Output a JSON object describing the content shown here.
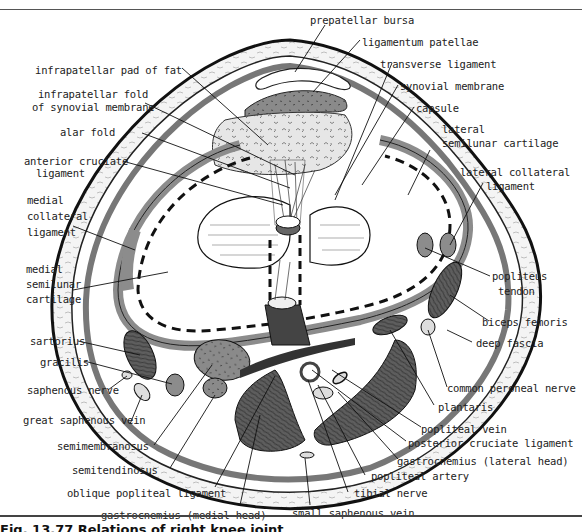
{
  "figure": {
    "caption": "Fig. 13.77 Relations of right knee joint",
    "colors": {
      "ink": "#1a1a1a",
      "tissue_gray": "#8c8c8c",
      "muscle_dark": "#555555",
      "fat_light": "#dcdcdc",
      "background": "#ffffff"
    }
  },
  "labels": {
    "prepatellar_bursa": "prepatellar bursa",
    "ligamentum_patellae": "ligamentum patellae",
    "infrapatellar_pad_of_fat": "infrapatellar pad of fat",
    "transverse_ligament": "transverse ligament",
    "infrapatellar_fold_1": "infrapatellar fold",
    "infrapatellar_fold_2": "of synovial membrane",
    "synovial_membrane": "synovial membrane",
    "capsule": "capsule",
    "alar_fold": "alar fold",
    "lateral_semilunar_cartilage_1": "lateral",
    "lateral_semilunar_cartilage_2": "semilunar cartilage",
    "anterior_cruciate_ligament_1": "anterior cruciate",
    "anterior_cruciate_ligament_2": "ligament",
    "lateral_collateral_ligament_1": "lateral collateral",
    "lateral_collateral_ligament_2": "ligament",
    "medial_collateral_ligament_1": "medial",
    "medial_collateral_ligament_2": "collateral",
    "medial_collateral_ligament_3": "ligament",
    "medial_semilunar_cartilage_1": "medial",
    "medial_semilunar_cartilage_2": "semilunar",
    "medial_semilunar_cartilage_3": "cartilage",
    "popliteus_tendon_1": "popliteus",
    "popliteus_tendon_2": "tendon",
    "biceps_femoris": "biceps femoris",
    "sartorius": "sartorius",
    "deep_fascia": "deep fascia",
    "gracilis": "gracilis",
    "common_peroneal_nerve": "common peroneal nerve",
    "saphenous_nerve": "saphenous nerve",
    "plantaris": "plantaris",
    "great_saphenous_vein": "great saphenous vein",
    "popliteal_vein": "popliteal vein",
    "posterior_cruciate_ligament": "posterior cruciate ligament",
    "semimembranosus": "semimembranosus",
    "gastrocnemius_lateral_head": "gastrocnemius (lateral head)",
    "semitendinosus": "semitendinosus",
    "popliteal_artery": "popliteal artery",
    "tibial_nerve": "tibial nerve",
    "oblique_popliteal_ligament": "oblique popliteal ligament",
    "small_saphenous_vein": "small saphenous vein",
    "gastrocnemius_medial_head": "gastrocnemius (medial head)"
  }
}
